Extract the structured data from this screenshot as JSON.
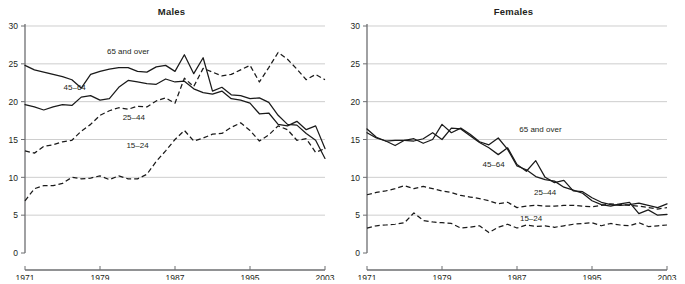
{
  "figure": {
    "panels": [
      "Males",
      "Females"
    ]
  },
  "chart_data": [
    {
      "type": "line",
      "title": "Males",
      "xlabel": "",
      "ylabel": "",
      "xlim": [
        1971,
        2003
      ],
      "ylim": [
        0,
        30
      ],
      "yticks": [
        0,
        5,
        10,
        15,
        20,
        25,
        30
      ],
      "xticks": [
        1971,
        1979,
        1987,
        1995,
        2003
      ],
      "tick_labels_x": [
        "1971",
        "1979",
        "1987",
        "1995",
        "2003"
      ],
      "tick_labels_y": [
        "0",
        "5",
        "10",
        "15",
        "20",
        "25",
        "30"
      ],
      "grid": "horizontal",
      "legend": "inline-annotations",
      "x": [
        1971,
        1972,
        1973,
        1974,
        1975,
        1976,
        1977,
        1978,
        1979,
        1980,
        1981,
        1982,
        1983,
        1984,
        1985,
        1986,
        1987,
        1988,
        1989,
        1990,
        1991,
        1992,
        1993,
        1994,
        1995,
        1996,
        1997,
        1998,
        1999,
        2000,
        2001,
        2002,
        2003
      ],
      "series": [
        {
          "name": "65 and over",
          "style": "solid",
          "values": [
            24.8,
            24.2,
            23.9,
            23.6,
            23.3,
            22.9,
            21.8,
            23.6,
            24.0,
            24.3,
            24.5,
            24.5,
            24.0,
            23.9,
            24.6,
            24.8,
            24.0,
            26.2,
            23.7,
            25.8,
            21.4,
            21.9,
            20.9,
            20.8,
            20.4,
            20.5,
            19.9,
            18.2,
            17.0,
            16.9,
            15.8,
            14.9,
            12.5
          ]
        },
        {
          "name": "45–64",
          "style": "solid",
          "values": [
            19.6,
            19.3,
            18.9,
            19.3,
            19.6,
            19.5,
            20.6,
            20.8,
            20.2,
            20.4,
            21.9,
            22.8,
            22.6,
            22.4,
            22.3,
            23.0,
            22.6,
            22.7,
            21.7,
            21.2,
            21.0,
            21.4,
            20.4,
            20.2,
            19.8,
            18.4,
            18.5,
            17.0,
            16.8,
            17.4,
            16.3,
            16.8,
            13.8
          ]
        },
        {
          "name": "25–44",
          "style": "dashed",
          "values": [
            13.5,
            13.2,
            14.1,
            14.3,
            14.7,
            14.9,
            16.1,
            17.0,
            18.2,
            18.8,
            19.2,
            19.0,
            19.4,
            19.3,
            20.1,
            20.5,
            19.8,
            23.1,
            22.0,
            24.4,
            23.9,
            23.4,
            23.6,
            24.2,
            24.8,
            22.6,
            24.5,
            26.5,
            25.6,
            24.3,
            22.9,
            23.6,
            22.9
          ]
        },
        {
          "name": "15–24",
          "style": "dashed",
          "values": [
            6.9,
            8.5,
            8.9,
            8.9,
            9.2,
            10.0,
            9.8,
            9.9,
            10.2,
            9.7,
            10.2,
            9.8,
            9.8,
            10.4,
            12.1,
            13.5,
            15.0,
            16.2,
            14.8,
            15.2,
            15.7,
            15.8,
            16.6,
            17.2,
            16.2,
            14.8,
            15.6,
            16.8,
            16.3,
            14.9,
            15.1,
            13.3,
            13.8
          ]
        }
      ]
    },
    {
      "type": "line",
      "title": "Females",
      "xlabel": "",
      "ylabel": "",
      "xlim": [
        1971,
        2003
      ],
      "ylim": [
        0,
        30
      ],
      "yticks": [
        0,
        5,
        10,
        15,
        20,
        25,
        30
      ],
      "xticks": [
        1971,
        1979,
        1987,
        1995,
        2003
      ],
      "tick_labels_x": [
        "1971",
        "1979",
        "1987",
        "1995",
        "2003"
      ],
      "tick_labels_y": [
        "0",
        "5",
        "10",
        "15",
        "20",
        "25",
        "30"
      ],
      "grid": "horizontal",
      "legend": "inline-annotations",
      "x": [
        1971,
        1972,
        1973,
        1974,
        1975,
        1976,
        1977,
        1978,
        1979,
        1980,
        1981,
        1982,
        1983,
        1984,
        1985,
        1986,
        1987,
        1988,
        1989,
        1990,
        1991,
        1992,
        1993,
        1994,
        1995,
        1996,
        1997,
        1998,
        1999,
        2000,
        2001,
        2002,
        2003
      ],
      "series": [
        {
          "name": "65 and over",
          "style": "solid",
          "values": [
            16.4,
            15.3,
            14.8,
            14.9,
            14.9,
            14.8,
            15.1,
            15.9,
            15.0,
            16.5,
            16.4,
            15.5,
            14.6,
            13.9,
            13.0,
            13.9,
            11.7,
            10.8,
            12.2,
            10.0,
            9.3,
            9.6,
            8.2,
            8.1,
            7.3,
            6.7,
            6.4,
            6.3,
            6.4,
            6.6,
            6.3,
            6.0,
            6.5
          ]
        },
        {
          "name": "45–64",
          "style": "solid",
          "values": [
            15.9,
            15.2,
            14.8,
            14.2,
            14.9,
            15.1,
            14.5,
            15.0,
            17.0,
            15.9,
            16.5,
            15.7,
            14.7,
            14.3,
            15.2,
            13.7,
            11.5,
            11.0,
            10.1,
            9.7,
            9.5,
            8.7,
            8.3,
            7.9,
            6.9,
            6.4,
            6.2,
            6.5,
            6.7,
            5.2,
            5.7,
            5.0,
            5.1
          ]
        },
        {
          "name": "25–44",
          "style": "dashed",
          "values": [
            7.7,
            8.0,
            8.2,
            8.5,
            8.9,
            8.5,
            8.8,
            8.5,
            8.2,
            8.0,
            7.6,
            7.4,
            7.2,
            6.9,
            6.5,
            6.7,
            6.0,
            6.2,
            6.3,
            6.2,
            6.2,
            6.3,
            6.3,
            6.2,
            6.1,
            6.3,
            6.5,
            6.4,
            6.3,
            6.2,
            6.0,
            5.8,
            6.0
          ]
        },
        {
          "name": "15–24",
          "style": "dashed",
          "values": [
            3.3,
            3.6,
            3.7,
            3.8,
            4.0,
            5.3,
            4.3,
            4.1,
            4.0,
            3.9,
            3.3,
            3.4,
            3.6,
            2.7,
            3.4,
            3.8,
            3.3,
            3.7,
            3.5,
            3.6,
            3.4,
            3.6,
            3.8,
            3.9,
            4.0,
            3.6,
            3.9,
            3.7,
            3.6,
            4.0,
            3.5,
            3.6,
            3.7
          ]
        }
      ]
    }
  ]
}
